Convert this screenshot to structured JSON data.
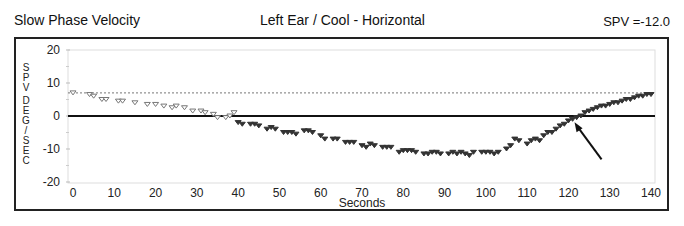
{
  "header": {
    "left_title": "Slow Phase Velocity",
    "center_title": "Left Ear / Cool - Horizontal",
    "spv_label": "SPV =-12.0"
  },
  "chart_data": {
    "type": "scatter",
    "title": "Left Ear / Cool - Horizontal",
    "xlabel": "Seconds",
    "ylabel": "SPV DEG/SEC",
    "xlim": [
      0,
      140
    ],
    "ylim": [
      -20,
      20
    ],
    "x_ticks": [
      0,
      10,
      20,
      30,
      40,
      50,
      60,
      70,
      80,
      90,
      100,
      110,
      120,
      130,
      140
    ],
    "y_ticks": [
      20,
      10,
      0,
      -10,
      -20
    ],
    "reference_lines": [
      {
        "y": 0,
        "style": "solid"
      },
      {
        "y": 7,
        "style": "dotted"
      }
    ],
    "annotation": {
      "type": "arrow",
      "points_to": [
        121,
        -1
      ]
    },
    "series": [
      {
        "name": "early",
        "marker": "hollow-triangle",
        "x": [
          0,
          4,
          5,
          7,
          8,
          11,
          12,
          15,
          18,
          20,
          22,
          24,
          25,
          27,
          29,
          31,
          32,
          34,
          35,
          37,
          38,
          39
        ],
        "y": [
          7,
          6.5,
          6,
          5,
          5,
          4.5,
          4.5,
          4,
          3.5,
          3.5,
          3,
          2.5,
          3,
          2.5,
          1.5,
          1.5,
          1,
          0.5,
          -0.5,
          -0.5,
          0,
          1
        ]
      },
      {
        "name": "late",
        "marker": "filled-triangle",
        "x": [
          40,
          41,
          43,
          44,
          45,
          47,
          48,
          49,
          51,
          52,
          53,
          54,
          56,
          57,
          58,
          60,
          61,
          63,
          64,
          66,
          67,
          68,
          70,
          71,
          72,
          73,
          75,
          76,
          77,
          79,
          80,
          81,
          82,
          83,
          85,
          86,
          87,
          88,
          89,
          91,
          92,
          93,
          94,
          95,
          96,
          97,
          99,
          100,
          101,
          102,
          103,
          105,
          106,
          107,
          108,
          110,
          111,
          112,
          113,
          114,
          115,
          116,
          117,
          118,
          119,
          120,
          121,
          122,
          123,
          124,
          125,
          126,
          127,
          128,
          129,
          130,
          131,
          132,
          133,
          134,
          135,
          136,
          137,
          138,
          139,
          140
        ],
        "y": [
          -2,
          -2.5,
          -2.5,
          -2.5,
          -3,
          -4,
          -3.5,
          -4,
          -5,
          -5,
          -5,
          -5.5,
          -4.5,
          -4.5,
          -5,
          -6,
          -7,
          -7,
          -7,
          -8,
          -8,
          -8,
          -9,
          -9.5,
          -8.5,
          -9,
          -9.5,
          -9.5,
          -9.5,
          -11,
          -10.5,
          -10.5,
          -10.5,
          -11,
          -11.5,
          -11.5,
          -11,
          -11,
          -11.5,
          -11.5,
          -11,
          -11.5,
          -11,
          -11.5,
          -12,
          -11,
          -11,
          -11,
          -11,
          -11.5,
          -11,
          -10,
          -9,
          -7,
          -7.5,
          -8.5,
          -7.5,
          -7,
          -7.5,
          -6,
          -5,
          -5,
          -4,
          -3,
          -2.5,
          -1.5,
          -1,
          -0.5,
          0,
          1,
          1.5,
          2,
          2.5,
          3,
          3,
          3.5,
          4,
          4,
          4.5,
          5,
          5,
          5.5,
          6,
          6,
          6.5,
          6.5
        ]
      }
    ]
  }
}
